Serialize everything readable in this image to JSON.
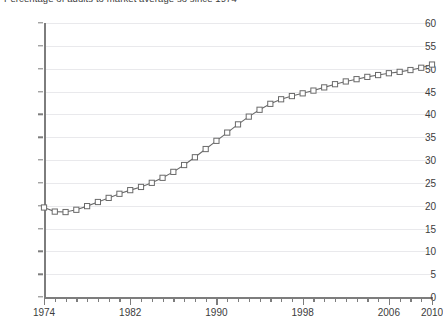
{
  "chart_data": {
    "type": "line",
    "title": "Percentage of adults to market average so since 1974",
    "xlabel": "",
    "ylabel": "",
    "xlim": [
      1974,
      2010
    ],
    "ylim": [
      0,
      60
    ],
    "ytick_step": 5,
    "grid": true,
    "legend": "none",
    "marker": "square",
    "series_color": "#6a6a6a",
    "grid_color": "#e9e9ec",
    "axis_color": "#7d7d7d",
    "yticks": [
      0,
      5,
      10,
      15,
      20,
      25,
      30,
      35,
      40,
      45,
      50,
      55,
      60
    ],
    "ytick_labels": [
      "0",
      "5",
      "10",
      "15",
      "20",
      "25",
      "30",
      "35",
      "40",
      "45",
      "50",
      "55",
      "60"
    ],
    "xticks_major": [
      1974,
      1982,
      1990,
      1998,
      2006,
      2010
    ],
    "xtick_labels": [
      "1974",
      "1982",
      "1990",
      "1998",
      "2006",
      "2010"
    ],
    "x": [
      1974,
      1975,
      1976,
      1977,
      1978,
      1979,
      1980,
      1981,
      1982,
      1983,
      1984,
      1985,
      1986,
      1987,
      1988,
      1989,
      1990,
      1991,
      1992,
      1993,
      1994,
      1995,
      1996,
      1997,
      1998,
      1999,
      2000,
      2001,
      2002,
      2003,
      2004,
      2005,
      2006,
      2007,
      2008,
      2009,
      2010
    ],
    "values": [
      19.6,
      18.7,
      18.6,
      19.1,
      19.9,
      20.8,
      21.7,
      22.6,
      23.4,
      24.1,
      25.0,
      26.1,
      27.4,
      28.9,
      30.6,
      32.4,
      34.2,
      36.0,
      37.8,
      39.5,
      41.0,
      42.3,
      43.3,
      44.0,
      44.6,
      45.2,
      45.9,
      46.6,
      47.2,
      47.7,
      48.2,
      48.6,
      49.0,
      49.3,
      49.7,
      50.2,
      50.9
    ]
  }
}
